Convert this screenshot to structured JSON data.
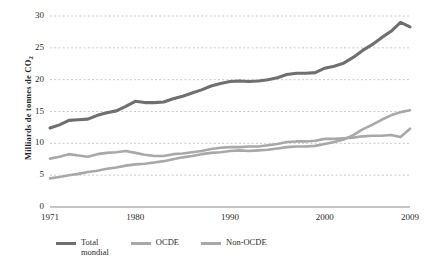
{
  "chart_data": {
    "type": "line",
    "title": "",
    "subtitle": "",
    "xlabel": "",
    "ylabel": "Milliards de tonnes de CO2",
    "ylabel_parts": {
      "main": "Milliards de tonnes  de CO",
      "sub": "2"
    },
    "xlim": [
      1971,
      2009
    ],
    "ylim": [
      0,
      30
    ],
    "ytick_labels": [
      "30",
      "25",
      "20",
      "15",
      "10",
      "5",
      "0"
    ],
    "ytick_values": [
      30,
      25,
      20,
      15,
      10,
      5,
      0
    ],
    "xtick_labels": [
      "1971",
      "1980",
      "1990",
      "2000",
      "2009"
    ],
    "xtick_values": [
      1971,
      1980,
      1990,
      2000,
      2009
    ],
    "grid": "horizontal-dotted",
    "legend_position": "bottom-left",
    "x": [
      1971,
      1972,
      1973,
      1974,
      1975,
      1976,
      1977,
      1978,
      1979,
      1980,
      1981,
      1982,
      1983,
      1984,
      1985,
      1986,
      1987,
      1988,
      1989,
      1990,
      1991,
      1992,
      1993,
      1994,
      1995,
      1996,
      1997,
      1998,
      1999,
      2000,
      2001,
      2002,
      2003,
      2004,
      2005,
      2006,
      2007,
      2008,
      2009
    ],
    "series": [
      {
        "name": "Total mondial",
        "label": "Total\nmondial",
        "color": "#6f6f6f",
        "width": 3.1,
        "values": [
          12.4,
          12.9,
          13.6,
          13.7,
          13.8,
          14.4,
          14.8,
          15.1,
          15.8,
          16.6,
          16.4,
          16.4,
          16.5,
          17.0,
          17.4,
          17.9,
          18.4,
          19.0,
          19.4,
          19.7,
          19.8,
          19.7,
          19.8,
          20.0,
          20.3,
          20.8,
          21.0,
          21.0,
          21.1,
          21.8,
          22.1,
          22.6,
          23.5,
          24.6,
          25.5,
          26.6,
          27.6,
          29.0,
          28.3
        ]
      },
      {
        "name": "OCDE",
        "label": "OCDE",
        "color": "#a8a8a8",
        "width": 2.6,
        "values": [
          7.6,
          7.9,
          8.3,
          8.1,
          7.9,
          8.3,
          8.5,
          8.6,
          8.8,
          8.5,
          8.2,
          8.0,
          8.0,
          8.3,
          8.4,
          8.6,
          8.8,
          9.1,
          9.3,
          9.4,
          9.4,
          9.5,
          9.5,
          9.7,
          9.9,
          10.2,
          10.3,
          10.3,
          10.4,
          10.7,
          10.7,
          10.8,
          10.9,
          11.1,
          11.2,
          11.2,
          11.3,
          11.0,
          12.3
        ]
      },
      {
        "name": "Non-OCDE",
        "label": "Non-OCDE",
        "color": "#a8a8a8",
        "width": 2.6,
        "values": [
          4.5,
          4.7,
          5.0,
          5.2,
          5.5,
          5.7,
          6.0,
          6.2,
          6.5,
          6.7,
          6.8,
          7.0,
          7.2,
          7.5,
          7.8,
          8.0,
          8.3,
          8.5,
          8.6,
          8.8,
          8.9,
          8.8,
          8.9,
          9.0,
          9.2,
          9.4,
          9.5,
          9.5,
          9.6,
          9.9,
          10.2,
          10.6,
          11.3,
          12.2,
          12.9,
          13.7,
          14.4,
          14.9,
          15.2
        ]
      }
    ]
  }
}
